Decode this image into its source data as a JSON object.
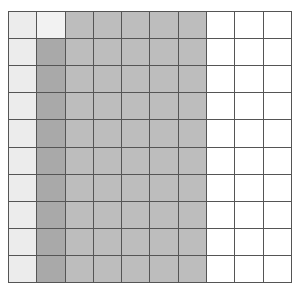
{
  "grid": {
    "rows": 10,
    "cols": 10,
    "colors": {
      "light": "#ececec",
      "lighter": "#f2f2f2",
      "dark": "#a9a9a9",
      "medium": "#bdbdbd",
      "empty": "#ffffff"
    },
    "column_shading": [
      [
        "light",
        "light",
        "light",
        "light",
        "light",
        "light",
        "light",
        "light",
        "light",
        "light"
      ],
      [
        "lighter",
        "dark",
        "dark",
        "dark",
        "dark",
        "dark",
        "dark",
        "dark",
        "dark",
        "dark"
      ],
      [
        "medium",
        "medium",
        "medium",
        "medium",
        "medium",
        "medium",
        "medium",
        "medium",
        "medium",
        "medium"
      ],
      [
        "medium",
        "medium",
        "medium",
        "medium",
        "medium",
        "medium",
        "medium",
        "medium",
        "medium",
        "medium"
      ],
      [
        "medium",
        "medium",
        "medium",
        "medium",
        "medium",
        "medium",
        "medium",
        "medium",
        "medium",
        "medium"
      ],
      [
        "medium",
        "medium",
        "medium",
        "medium",
        "medium",
        "medium",
        "medium",
        "medium",
        "medium",
        "medium"
      ],
      [
        "medium",
        "medium",
        "medium",
        "medium",
        "medium",
        "medium",
        "medium",
        "medium",
        "medium",
        "medium"
      ],
      [
        "empty",
        "empty",
        "empty",
        "empty",
        "empty",
        "empty",
        "empty",
        "empty",
        "empty",
        "empty"
      ],
      [
        "empty",
        "empty",
        "empty",
        "empty",
        "empty",
        "empty",
        "empty",
        "empty",
        "empty",
        "empty"
      ],
      [
        "empty",
        "empty",
        "empty",
        "empty",
        "empty",
        "empty",
        "empty",
        "empty",
        "empty",
        "empty"
      ]
    ]
  }
}
